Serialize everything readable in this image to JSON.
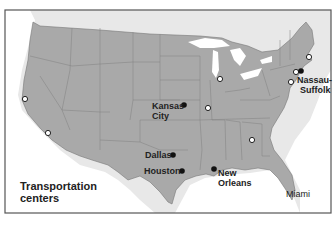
{
  "map": {
    "title": "Transportation centers",
    "legend_lines": [
      "Transportation",
      "centers"
    ],
    "colors": {
      "land_us": "#a9a9a9",
      "land_canada_mexico": "#e6e6e6",
      "water": "#ffffff",
      "border": "#7a7a7a",
      "frame": "#555555",
      "filled_marker": "#111111",
      "open_marker": "#ffffff"
    },
    "labeled_centers": [
      {
        "name": "Kansas City",
        "lines": [
          "Kansas",
          "City"
        ],
        "marker": "filled"
      },
      {
        "name": "Dallas",
        "lines": [
          "Dallas"
        ],
        "marker": "filled"
      },
      {
        "name": "Houston",
        "lines": [
          "Houston"
        ],
        "marker": "filled"
      },
      {
        "name": "New Orleans",
        "lines": [
          "New",
          "Orleans"
        ],
        "marker": "filled"
      },
      {
        "name": "Nassau-Suffolk",
        "lines": [
          "Nassau-",
          "Suffolk"
        ],
        "marker": "filled"
      },
      {
        "name": "Miami",
        "lines": [
          "Miami"
        ],
        "marker": "none"
      }
    ],
    "open_marker_count": 9
  }
}
